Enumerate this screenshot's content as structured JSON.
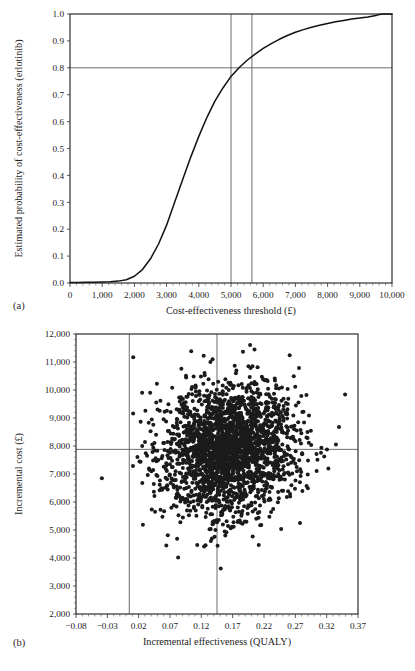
{
  "figure": {
    "panel_a_letter": "(a)",
    "panel_b_letter": "(b)"
  },
  "chart_data": [
    {
      "type": "line",
      "panel": "(a)",
      "title": "",
      "xlabel": "Cost-effectiveness threshold (£)",
      "ylabel": "Estimated probability of cost-effectiveness (erlotinib)",
      "xlim": [
        0,
        10000
      ],
      "ylim": [
        0.0,
        1.0
      ],
      "grid": false,
      "legend": "none",
      "xticklabels": [
        "0",
        "1,000",
        "2,000",
        "3,000",
        "4,000",
        "5,000",
        "6,000",
        "7,000",
        "8,000",
        "9,000",
        "10,000"
      ],
      "xtickvalues": [
        0,
        1000,
        2000,
        3000,
        4000,
        5000,
        6000,
        7000,
        8000,
        9000,
        10000
      ],
      "yticklabels": [
        "0.0",
        "0.1",
        "0.2",
        "0.3",
        "0.4",
        "0.5",
        "0.6",
        "0.7",
        "0.8",
        "0.9",
        "1.0"
      ],
      "ytickvalues": [
        0.0,
        0.1,
        0.2,
        0.3,
        0.4,
        0.5,
        0.6,
        0.7,
        0.8,
        0.9,
        1.0
      ],
      "series": [
        {
          "name": "Cost-effectiveness acceptability curve (erlotinib)",
          "x": [
            0,
            250,
            500,
            750,
            1000,
            1250,
            1500,
            1750,
            2000,
            2250,
            2500,
            2750,
            3000,
            3250,
            3500,
            3750,
            4000,
            4250,
            4500,
            4750,
            5000,
            5250,
            5500,
            5750,
            6000,
            6250,
            6500,
            6750,
            7000,
            7250,
            7500,
            7750,
            8000,
            8250,
            8500,
            8750,
            9000,
            9250,
            9500,
            9600,
            9750,
            10000
          ],
          "y": [
            0.002,
            0.002,
            0.003,
            0.003,
            0.004,
            0.005,
            0.007,
            0.012,
            0.025,
            0.05,
            0.09,
            0.145,
            0.215,
            0.3,
            0.385,
            0.468,
            0.545,
            0.615,
            0.676,
            0.725,
            0.768,
            0.8,
            0.828,
            0.851,
            0.872,
            0.89,
            0.906,
            0.92,
            0.932,
            0.942,
            0.951,
            0.958,
            0.965,
            0.971,
            0.976,
            0.981,
            0.985,
            0.989,
            0.994,
            0.998,
            1.0,
            1.0
          ]
        }
      ],
      "reference_lines": [
        {
          "orientation": "horizontal",
          "value": 0.8,
          "label": "probability 0.8"
        },
        {
          "orientation": "vertical",
          "value": 5000,
          "label": "threshold 5,000"
        },
        {
          "orientation": "vertical",
          "value": 5650,
          "label": "threshold at 0.8 probability"
        }
      ]
    },
    {
      "type": "scatter",
      "panel": "(b)",
      "title": "",
      "xlabel": "Incremental effectiveness (QUALY)",
      "ylabel": "Incremental cost (£)",
      "xlim": [
        -0.08,
        0.37
      ],
      "ylim": [
        2000,
        12000
      ],
      "grid": false,
      "legend": "none",
      "xticklabels": [
        "−0.08",
        "−0.03",
        "0.02",
        "0.07",
        "0.12",
        "0.17",
        "0.22",
        "0.27",
        "0.32",
        "0.37"
      ],
      "xtickvalues": [
        -0.08,
        -0.03,
        0.02,
        0.07,
        0.12,
        0.17,
        0.22,
        0.27,
        0.32,
        0.37
      ],
      "yticklabels": [
        "2,000",
        "3,000",
        "4,000",
        "5,000",
        "6,000",
        "7,000",
        "8,000",
        "9,000",
        "10,000",
        "11,000",
        "12,000"
      ],
      "ytickvalues": [
        2000,
        3000,
        4000,
        5000,
        6000,
        7000,
        8000,
        9000,
        10000,
        11000,
        12000
      ],
      "cloud": {
        "n_points": 2400,
        "mean_x": 0.165,
        "mean_y": 7880,
        "sd_x": 0.052,
        "sd_y": 1180,
        "correlation": 0.12,
        "marker": "filled-circle",
        "marker_color": "#1b1b1b",
        "marker_size": 2.0
      },
      "reference_lines": [
        {
          "orientation": "horizontal",
          "value": 7880,
          "label": "mean incremental cost"
        },
        {
          "orientation": "vertical",
          "value": 0.005,
          "label": "zero incremental effectiveness"
        },
        {
          "orientation": "vertical",
          "value": 0.145,
          "label": "mean incremental effectiveness"
        }
      ]
    }
  ]
}
